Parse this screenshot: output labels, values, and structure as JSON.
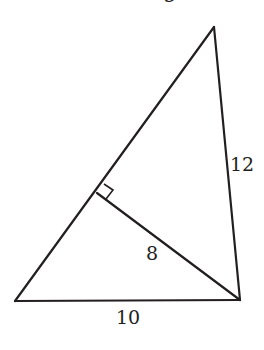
{
  "figure": {
    "type": "triangle-with-altitude",
    "top_cut_text": "g",
    "vertices": {
      "left": [
        15,
        301
      ],
      "right": [
        240,
        300
      ],
      "apex": [
        214,
        27
      ]
    },
    "altitude": {
      "from": [
        240,
        300
      ],
      "foot": [
        97,
        193
      ],
      "right_angle_marker": [
        [
          97,
          193
        ],
        [
          104,
          184
        ],
        [
          113,
          190
        ],
        [
          106,
          199
        ]
      ]
    },
    "labels": {
      "side_right": "12",
      "altitude": "8",
      "base": "10"
    },
    "colors": {
      "stroke": "#231f20",
      "background": "#ffffff"
    }
  }
}
